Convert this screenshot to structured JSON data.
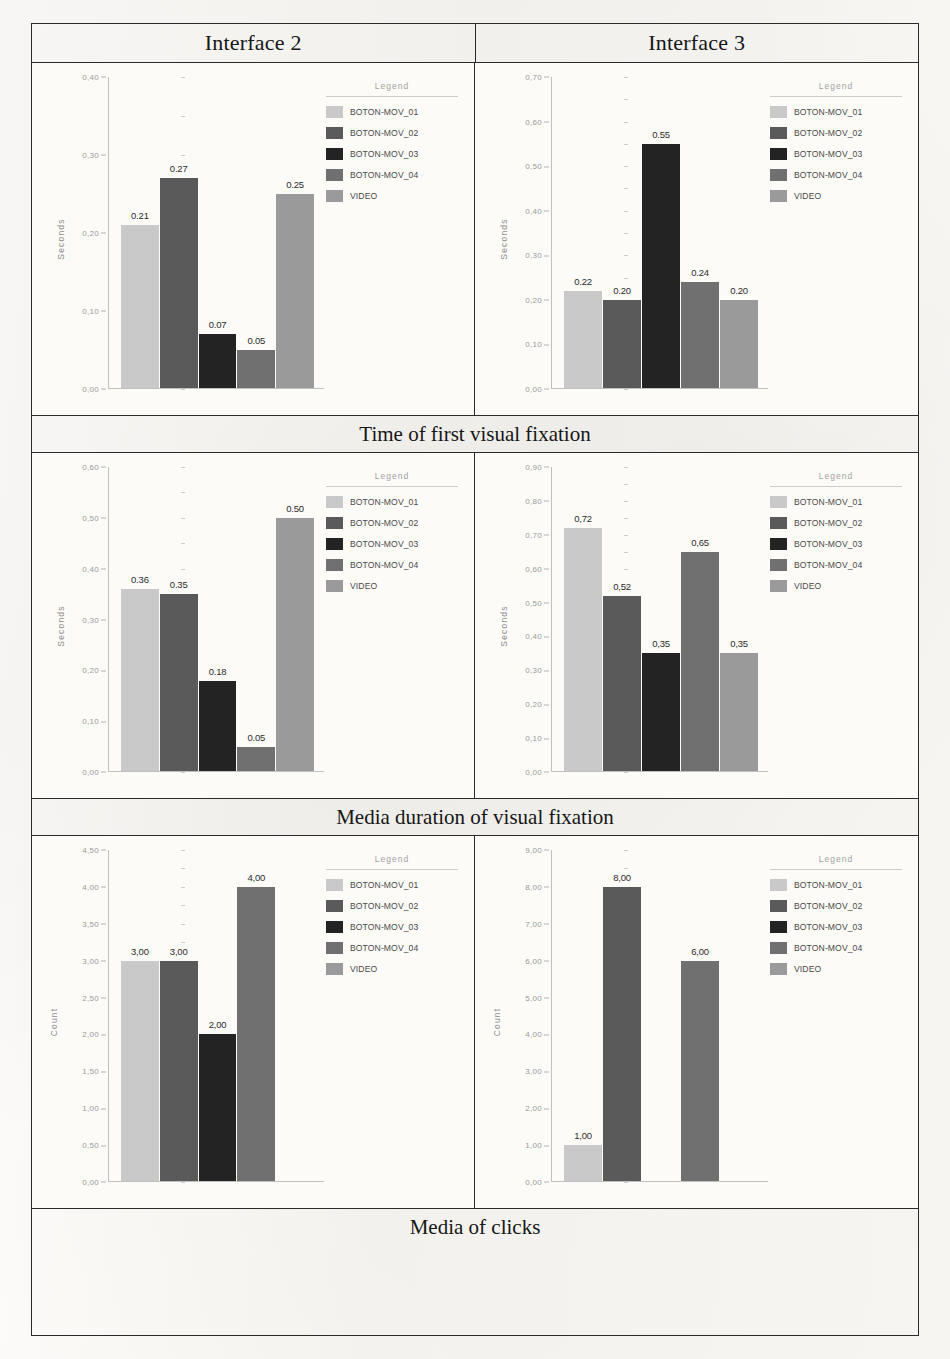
{
  "document": {
    "type": "scanned-table-of-charts",
    "columns": [
      "Interface 2",
      "Interface 3"
    ]
  },
  "header": {
    "col1": "Interface 2",
    "col2": "Interface 3"
  },
  "captions": {
    "row1": "Time of first visual fixation",
    "row2": "Media duration of visual fixation",
    "row3": "Media of clicks"
  },
  "legend": {
    "title": "Legend",
    "items": [
      {
        "label": "BOTON-MOV_01",
        "color": "#c9c9c9"
      },
      {
        "label": "BOTON-MOV_02",
        "color": "#5a5a5a"
      },
      {
        "label": "BOTON-MOV_03",
        "color": "#232323"
      },
      {
        "label": "BOTON-MOV_04",
        "color": "#707070"
      },
      {
        "label": "VIDEO",
        "color": "#9a9a9a"
      }
    ]
  },
  "chart_data": [
    {
      "id": "interface2-time-first-fixation",
      "type": "bar",
      "title": "Interface 2",
      "caption": "Time of first visual fixation",
      "xlabel": "",
      "ylabel": "Seconds",
      "ylim": [
        0.0,
        0.4
      ],
      "ytick_step": 0.1,
      "ytick_labels": [
        "0,40",
        "0,30",
        "0,20",
        "0,10",
        "0,00"
      ],
      "grid": false,
      "legend_position": "right",
      "categories": [
        "BOTON-MOV_01",
        "BOTON-MOV_02",
        "BOTON-MOV_03",
        "BOTON-MOV_04",
        "VIDEO"
      ],
      "values": [
        0.21,
        0.27,
        0.07,
        0.05,
        0.25
      ],
      "data_labels": [
        "0.21",
        "0.27",
        "0.07",
        "0.05",
        "0.25"
      ],
      "colors": [
        "#c9c9c9",
        "#5a5a5a",
        "#232323",
        "#707070",
        "#9a9a9a"
      ]
    },
    {
      "id": "interface3-time-first-fixation",
      "type": "bar",
      "title": "Interface 3",
      "caption": "Time of first visual fixation",
      "xlabel": "",
      "ylabel": "Seconds",
      "ylim": [
        0.0,
        0.7
      ],
      "ytick_step": 0.1,
      "ytick_labels": [
        "0,70",
        "0,60",
        "0,50",
        "0,40",
        "0,30",
        "0,20",
        "0,10",
        "0,00"
      ],
      "grid": false,
      "legend_position": "right",
      "categories": [
        "BOTON-MOV_01",
        "BOTON-MOV_02",
        "BOTON-MOV_03",
        "BOTON-MOV_04",
        "VIDEO"
      ],
      "values": [
        0.22,
        0.2,
        0.55,
        0.24,
        0.2
      ],
      "data_labels": [
        "0.22",
        "0.20",
        "0.55",
        "0.24",
        "0.20"
      ],
      "colors": [
        "#c9c9c9",
        "#5a5a5a",
        "#232323",
        "#707070",
        "#9a9a9a"
      ]
    },
    {
      "id": "interface2-media-duration-fixation",
      "type": "bar",
      "title": "Interface 2",
      "caption": "Media duration of visual fixation",
      "xlabel": "",
      "ylabel": "Seconds",
      "ylim": [
        0.0,
        0.6
      ],
      "ytick_step": 0.1,
      "ytick_labels": [
        "0,60",
        "0,50",
        "0,40",
        "0,30",
        "0,20",
        "0,10",
        "0,00"
      ],
      "grid": false,
      "legend_position": "right",
      "categories": [
        "BOTON-MOV_01",
        "BOTON-MOV_02",
        "BOTON-MOV_03",
        "BOTON-MOV_04",
        "VIDEO"
      ],
      "values": [
        0.36,
        0.35,
        0.18,
        0.05,
        0.5
      ],
      "data_labels": [
        "0.36",
        "0.35",
        "0.18",
        "0.05",
        "0.50"
      ],
      "colors": [
        "#c9c9c9",
        "#5a5a5a",
        "#232323",
        "#707070",
        "#9a9a9a"
      ]
    },
    {
      "id": "interface3-media-duration-fixation",
      "type": "bar",
      "title": "Interface 3",
      "caption": "Media duration of visual fixation",
      "xlabel": "",
      "ylabel": "Seconds",
      "ylim": [
        0.0,
        0.9
      ],
      "ytick_step": 0.1,
      "ytick_labels": [
        "0,90",
        "0,80",
        "0,70",
        "0,60",
        "0,50",
        "0,40",
        "0,30",
        "0,20",
        "0,10",
        "0,00"
      ],
      "grid": false,
      "legend_position": "right",
      "categories": [
        "BOTON-MOV_01",
        "BOTON-MOV_02",
        "BOTON-MOV_03",
        "BOTON-MOV_04",
        "VIDEO"
      ],
      "values": [
        0.72,
        0.52,
        0.35,
        0.65,
        0.35
      ],
      "data_labels": [
        "0,72",
        "0,52",
        "0,35",
        "0,65",
        "0,35"
      ],
      "colors": [
        "#c9c9c9",
        "#5a5a5a",
        "#232323",
        "#707070",
        "#9a9a9a"
      ]
    },
    {
      "id": "interface2-media-clicks",
      "type": "bar",
      "title": "Interface 2",
      "caption": "Media of clicks",
      "xlabel": "",
      "ylabel": "Count",
      "ylim": [
        0.0,
        4.5
      ],
      "ytick_step": 0.5,
      "ytick_labels": [
        "4,50",
        "4,00",
        "3,50",
        "3,00",
        "2,50",
        "2,00",
        "1,50",
        "1,00",
        "0,50",
        "0,00"
      ],
      "grid": false,
      "legend_position": "right",
      "categories": [
        "BOTON-MOV_01",
        "BOTON-MOV_02",
        "BOTON-MOV_03",
        "BOTON-MOV_04",
        "VIDEO"
      ],
      "values": [
        3.0,
        3.0,
        2.0,
        4.0,
        0.0
      ],
      "data_labels": [
        "3,00",
        "3,00",
        "2,00",
        "4,00",
        ""
      ],
      "colors": [
        "#c9c9c9",
        "#5a5a5a",
        "#232323",
        "#707070",
        "#9a9a9a"
      ]
    },
    {
      "id": "interface3-media-clicks",
      "type": "bar",
      "title": "Interface 3",
      "caption": "Media of clicks",
      "xlabel": "",
      "ylabel": "Count",
      "ylim": [
        0.0,
        9.0
      ],
      "ytick_step": 1.0,
      "ytick_labels": [
        "9,00",
        "8,00",
        "7,00",
        "6,00",
        "5,00",
        "4,00",
        "3,00",
        "2,00",
        "1,00",
        "0,00"
      ],
      "grid": false,
      "legend_position": "right",
      "categories": [
        "BOTON-MOV_01",
        "BOTON-MOV_02",
        "BOTON-MOV_03",
        "BOTON-MOV_04",
        "VIDEO"
      ],
      "values": [
        1.0,
        8.0,
        0.0,
        6.0,
        0.0
      ],
      "data_labels": [
        "1,00",
        "8,00",
        "",
        "6,00",
        ""
      ],
      "colors": [
        "#c9c9c9",
        "#5a5a5a",
        "#232323",
        "#707070",
        "#9a9a9a"
      ]
    }
  ]
}
